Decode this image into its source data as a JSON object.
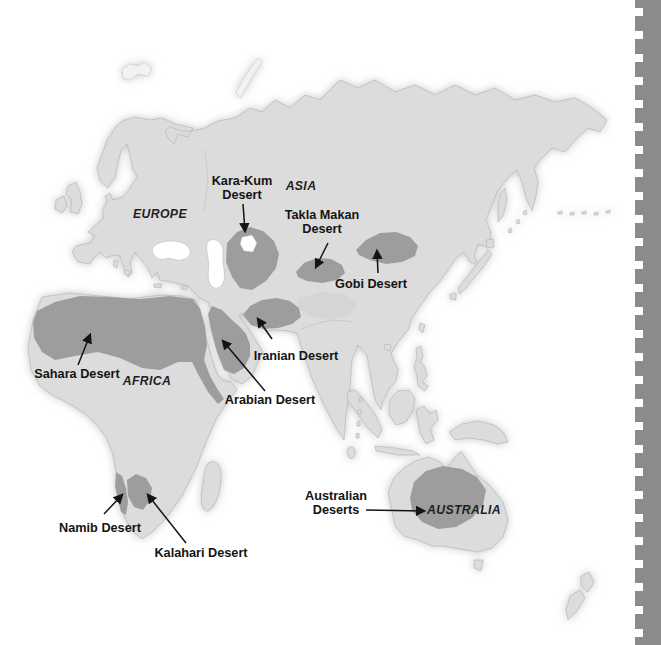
{
  "map": {
    "continent_labels": [
      {
        "name": "Europe",
        "label": "EUROPE"
      },
      {
        "name": "Asia",
        "label": "ASIA"
      },
      {
        "name": "Africa",
        "label": "AFRICA"
      },
      {
        "name": "Australia",
        "label": "AUSTRALIA"
      }
    ],
    "desert_labels": [
      {
        "name": "Kara-Kum Desert",
        "label": "Kara-Kum\nDesert"
      },
      {
        "name": "Takla Makan Desert",
        "label": "Takla Makan\nDesert"
      },
      {
        "name": "Gobi Desert",
        "label": "Gobi Desert"
      },
      {
        "name": "Iranian Desert",
        "label": "Iranian Desert"
      },
      {
        "name": "Arabian Desert",
        "label": "Arabian Desert"
      },
      {
        "name": "Sahara Desert",
        "label": "Sahara Desert"
      },
      {
        "name": "Namib Desert",
        "label": "Namib Desert"
      },
      {
        "name": "Kalahari Desert",
        "label": "Kalahari Desert"
      },
      {
        "name": "Australian Deserts",
        "label": "Australian\nDeserts"
      }
    ],
    "colors": {
      "ocean": "#ffffff",
      "land": "#dcdcdc",
      "desert": "#9d9d9d",
      "coast": "#b0b0b0",
      "label_text": "#141414",
      "binding_strip": "#8b8b8b"
    }
  }
}
